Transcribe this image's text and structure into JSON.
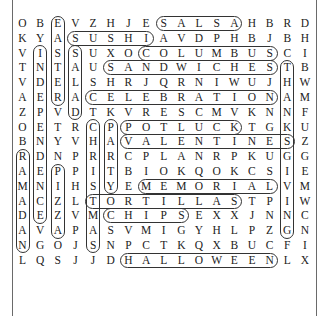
{
  "puzzle": {
    "rows": [
      "OBEVZHJESALSAHBRD",
      "KYASUSHIAVDPHBJBH",
      "VISSUXOCOLUMBUSCI",
      "TNTAUSANDWICHESTB",
      "VDELSHRJQRNIWUJHW",
      "AERACELEBRATIONAM",
      "ZPVDTKVRESCMVKNNF",
      "OETRCPPOTLUCKTGKU",
      "BNYVHAVALENTINESZ",
      "RDNPRRCPLANRPKUGG",
      "AEPPITBIOKQOKCSIE",
      "MNIHSYEMEMORIALVM",
      "ACZLTORTILLASTPIW",
      "DEZVMCHIPSEXXJNNC",
      "AVAPASVMIGYHLPZGN",
      "NGOJSNPCTKQXBUCFI",
      "LQSJJDHALLOWEENLX"
    ],
    "found_words": [
      {
        "word": "SALSA",
        "dir": "h",
        "row": 0,
        "col": 8,
        "len": 5
      },
      {
        "word": "SUSHI",
        "dir": "h",
        "row": 1,
        "col": 3,
        "len": 5
      },
      {
        "word": "COLUMBUS",
        "dir": "h",
        "row": 2,
        "col": 7,
        "len": 8
      },
      {
        "word": "SANDWICHES",
        "dir": "h",
        "row": 3,
        "col": 5,
        "len": 10
      },
      {
        "word": "CELEBRATION",
        "dir": "h",
        "row": 5,
        "col": 4,
        "len": 11
      },
      {
        "word": "POTLUCK",
        "dir": "h",
        "row": 7,
        "col": 6,
        "len": 7
      },
      {
        "word": "VALENTINES",
        "dir": "h",
        "row": 8,
        "col": 6,
        "len": 10
      },
      {
        "word": "MEMORIAL",
        "dir": "h",
        "row": 11,
        "col": 7,
        "len": 8
      },
      {
        "word": "TORTILLAS",
        "dir": "h",
        "row": 12,
        "col": 4,
        "len": 9
      },
      {
        "word": "CHIPS",
        "dir": "h",
        "row": 13,
        "col": 5,
        "len": 5
      },
      {
        "word": "HALLOWEEN",
        "dir": "h",
        "row": 16,
        "col": 6,
        "len": 9
      },
      {
        "word": "EASTER",
        "dir": "v",
        "row": 0,
        "col": 2,
        "len": 6
      },
      {
        "word": "INDEPENDENCE",
        "dir": "v",
        "row": 2,
        "col": 1,
        "len": 12
      },
      {
        "word": "SALAD",
        "dir": "v",
        "row": 2,
        "col": 3,
        "len": 5
      },
      {
        "word": "THANKSGIVING",
        "dir": "v",
        "row": 3,
        "col": 15,
        "len": 12
      },
      {
        "word": "CHRISTMAS",
        "dir": "v",
        "row": 7,
        "col": 4,
        "len": 9
      },
      {
        "word": "PARTY",
        "dir": "v",
        "row": 7,
        "col": 5,
        "len": 5
      },
      {
        "word": "RAMADAN",
        "dir": "v",
        "row": 9,
        "col": 0,
        "len": 7
      },
      {
        "word": "PIZZA",
        "dir": "v",
        "row": 10,
        "col": 2,
        "len": 5
      }
    ]
  }
}
